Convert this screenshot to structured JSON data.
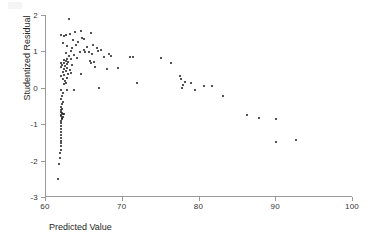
{
  "chart_data": {
    "type": "scatter",
    "title": "",
    "xlabel": "Predicted Value",
    "ylabel": "Studentized Residual",
    "xlim": [
      60,
      100
    ],
    "ylim": [
      -3,
      2
    ],
    "xticks": [
      60,
      70,
      80,
      90,
      100
    ],
    "yticks": [
      2,
      1,
      0,
      -1,
      -2,
      -3
    ],
    "xtick_labels": [
      "60",
      "70",
      "80",
      "90",
      "100"
    ],
    "ytick_labels": [
      "2",
      "1",
      "0",
      "-1",
      "-2",
      "-3"
    ],
    "grid": false,
    "legend": false,
    "marker": "filled-circle",
    "marker_color": "#1a1a1a",
    "points": [
      [
        61.6,
        -2.5
      ],
      [
        61.7,
        -2.08
      ],
      [
        61.8,
        -1.93
      ],
      [
        61.8,
        -1.8
      ],
      [
        61.9,
        -1.7
      ],
      [
        61.9,
        -1.6
      ],
      [
        61.9,
        -1.52
      ],
      [
        62.0,
        -1.45
      ],
      [
        62.0,
        -1.38
      ],
      [
        62.0,
        -1.3
      ],
      [
        62.0,
        -1.22
      ],
      [
        62.0,
        -1.14
      ],
      [
        62.0,
        -1.06
      ],
      [
        62.0,
        -0.98
      ],
      [
        62.0,
        -0.92
      ],
      [
        62.1,
        -0.86
      ],
      [
        62.1,
        -0.82
      ],
      [
        62.2,
        -0.79
      ],
      [
        62.0,
        -0.77
      ],
      [
        61.9,
        -0.75
      ],
      [
        62.2,
        -0.73
      ],
      [
        62.3,
        -0.71
      ],
      [
        62.1,
        -0.69
      ],
      [
        62.0,
        -0.66
      ],
      [
        61.9,
        -0.62
      ],
      [
        62.1,
        -0.58
      ],
      [
        62.0,
        -0.52
      ],
      [
        62.1,
        -0.45
      ],
      [
        62.2,
        -0.38
      ],
      [
        62.0,
        -0.3
      ],
      [
        62.1,
        -0.22
      ],
      [
        62.2,
        -0.14
      ],
      [
        62.0,
        -0.06
      ],
      [
        62.8,
        -0.07
      ],
      [
        63.6,
        -0.07
      ],
      [
        66.9,
        0.0
      ],
      [
        62.3,
        0.1
      ],
      [
        62.6,
        0.13
      ],
      [
        62.5,
        0.2
      ],
      [
        62.2,
        0.23
      ],
      [
        62.7,
        0.28
      ],
      [
        71.8,
        0.12
      ],
      [
        62.0,
        0.33
      ],
      [
        62.4,
        0.36
      ],
      [
        62.9,
        0.38
      ],
      [
        63.2,
        0.41
      ],
      [
        62.2,
        0.44
      ],
      [
        64.6,
        0.37
      ],
      [
        62.6,
        0.47
      ],
      [
        63.1,
        0.5
      ],
      [
        62.3,
        0.52
      ],
      [
        62.8,
        0.55
      ],
      [
        62.0,
        0.57
      ],
      [
        67.9,
        0.53
      ],
      [
        69.4,
        0.54
      ],
      [
        66.4,
        0.57
      ],
      [
        62.5,
        0.6
      ],
      [
        63.4,
        0.62
      ],
      [
        62.1,
        0.64
      ],
      [
        62.7,
        0.66
      ],
      [
        65.9,
        0.68
      ],
      [
        66.2,
        0.7
      ],
      [
        62.3,
        0.68
      ],
      [
        62.9,
        0.71
      ],
      [
        61.9,
        0.67
      ],
      [
        62.6,
        0.73
      ],
      [
        65.7,
        0.74
      ],
      [
        62.4,
        0.76
      ],
      [
        76.3,
        0.69
      ],
      [
        63.3,
        0.78
      ],
      [
        62.8,
        0.8
      ],
      [
        64.0,
        0.82
      ],
      [
        67.6,
        0.86
      ],
      [
        70.9,
        0.84
      ],
      [
        71.3,
        0.84
      ],
      [
        75.0,
        0.83
      ],
      [
        68.5,
        0.88
      ],
      [
        63.0,
        0.88
      ],
      [
        63.7,
        0.9
      ],
      [
        66.0,
        0.93
      ],
      [
        68.2,
        0.92
      ],
      [
        62.6,
        0.95
      ],
      [
        64.4,
        0.97
      ],
      [
        65.1,
        0.98
      ],
      [
        65.6,
        0.99
      ],
      [
        66.8,
        1.0
      ],
      [
        63.2,
        1.02
      ],
      [
        64.9,
        1.03
      ],
      [
        67.2,
        1.04
      ],
      [
        63.4,
        1.08
      ],
      [
        66.6,
        1.1
      ],
      [
        65.3,
        1.12
      ],
      [
        62.8,
        1.15
      ],
      [
        63.9,
        1.18
      ],
      [
        66.1,
        1.17
      ],
      [
        62.2,
        1.22
      ],
      [
        64.2,
        1.25
      ],
      [
        63.5,
        1.3
      ],
      [
        65.0,
        1.34
      ],
      [
        64.7,
        1.38
      ],
      [
        62.4,
        1.42
      ],
      [
        62.0,
        1.45
      ],
      [
        63.1,
        1.48
      ],
      [
        65.8,
        1.5
      ],
      [
        62.6,
        1.45
      ],
      [
        63.8,
        1.52
      ],
      [
        64.5,
        1.56
      ],
      [
        63.0,
        1.88
      ],
      [
        77.5,
        0.32
      ],
      [
        77.6,
        0.25
      ],
      [
        78.1,
        0.17
      ],
      [
        77.8,
        0.07
      ],
      [
        77.7,
        -0.01
      ],
      [
        78.9,
        0.14
      ],
      [
        79.4,
        -0.05
      ],
      [
        80.6,
        0.06
      ],
      [
        81.6,
        0.05
      ],
      [
        83.0,
        -0.22
      ],
      [
        86.2,
        -0.74
      ],
      [
        87.8,
        -0.84
      ],
      [
        90.0,
        -0.87
      ],
      [
        90.0,
        -1.48
      ],
      [
        92.6,
        -1.43
      ]
    ]
  }
}
